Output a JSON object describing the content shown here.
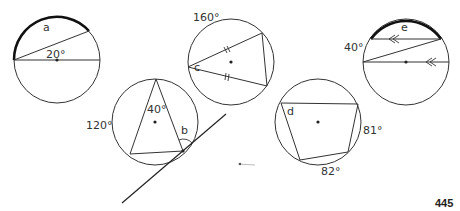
{
  "figures": [
    {
      "id": "circle-a",
      "unknown_label": "a",
      "given_angle": "20°",
      "description": "Circle with diameter and chord from diameter end; arc a highlighted"
    },
    {
      "id": "circle-c",
      "unknown_label": "c",
      "given_angle": "160°",
      "description": "Isosceles inscribed triangle with equal-side tick marks; arc 160° given"
    },
    {
      "id": "circle-b",
      "unknown_label": "b",
      "given_angles": [
        "40°",
        "120°"
      ],
      "description": "Inscribed triangle with tangent line at vertex; angle b between chord and tangent"
    },
    {
      "id": "circle-d",
      "unknown_label": "d",
      "given_angles": [
        "81°",
        "82°"
      ],
      "description": "Cyclic quadrilateral with two arc measures given"
    },
    {
      "id": "circle-e",
      "unknown_label": "e",
      "given_angle": "40°",
      "description": "Parallel chord and diameter (arrow marks) with transversal chord; arc e highlighted"
    }
  ],
  "page_number": "445",
  "colors": {
    "stroke": "#333333",
    "highlight": "#111111",
    "text": "#333333"
  }
}
